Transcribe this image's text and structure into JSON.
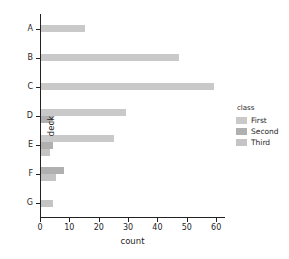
{
  "chart_data": {
    "type": "bar",
    "orientation": "horizontal",
    "grouped": true,
    "title": "",
    "xlabel": "count",
    "ylabel": "deck",
    "categories": [
      "A",
      "B",
      "C",
      "D",
      "E",
      "F",
      "G"
    ],
    "xticks": [
      0,
      10,
      20,
      30,
      40,
      50,
      60
    ],
    "xlim": [
      0,
      63
    ],
    "grid": false,
    "legend": {
      "title": "class",
      "position": "right",
      "entries": [
        "First",
        "Second",
        "Third"
      ]
    },
    "series": [
      {
        "name": "First",
        "color": "#c9c9c9",
        "values": [
          15,
          47,
          59,
          29,
          25,
          0,
          0
        ]
      },
      {
        "name": "Second",
        "color": "#b0b0b0",
        "values": [
          0,
          0,
          0,
          4,
          4,
          8,
          0
        ]
      },
      {
        "name": "Third",
        "color": "#c4c4c4",
        "values": [
          0,
          0,
          0,
          0,
          3,
          5,
          4
        ]
      }
    ]
  }
}
